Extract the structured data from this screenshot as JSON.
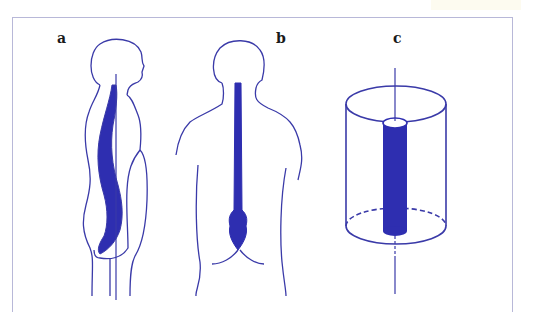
{
  "figure": {
    "panels": [
      {
        "id": "a",
        "label": "a",
        "description": "Side view of human body with spine curvature and vertical axis line"
      },
      {
        "id": "b",
        "label": "b",
        "description": "Back view of human torso with spinal column"
      },
      {
        "id": "c",
        "label": "c",
        "description": "Cylinder model with inner solid rod and central axis"
      }
    ],
    "colors": {
      "stroke": "#3a3aa8",
      "fill": "#2e2eb0",
      "frame": "#b8b8d8",
      "label": "#1a1a1a"
    }
  }
}
